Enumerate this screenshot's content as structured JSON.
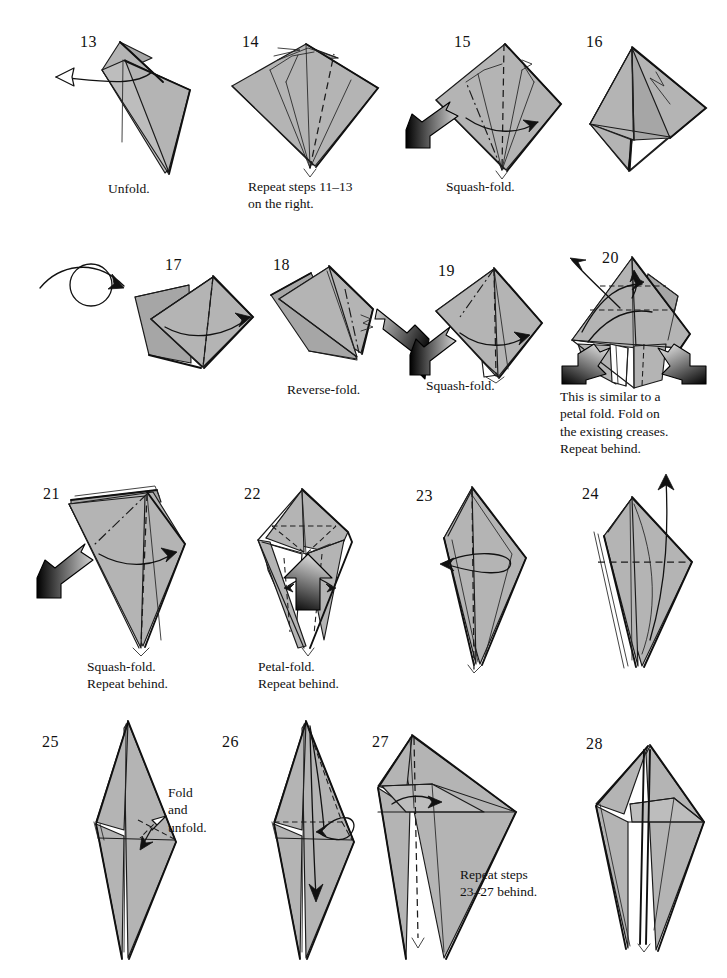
{
  "document": {
    "kind": "origami-folding-instructions",
    "page_background": "#ffffff",
    "paper_fill": "#b4b4b4",
    "line_color": "#1a1a1a",
    "step_range": "13-28"
  },
  "steps": [
    {
      "number": "13",
      "caption": "Unfold.",
      "action": "unfold",
      "arrows": [
        "open-arrow-left"
      ]
    },
    {
      "number": "14",
      "caption": "Repeat steps 11–13\non the right.",
      "action": "repeat",
      "arrows": []
    },
    {
      "number": "15",
      "caption": "Squash-fold.",
      "action": "squash-fold",
      "arrows": [
        "push-arrow",
        "fold-arrow-right"
      ]
    },
    {
      "number": "16",
      "caption": "",
      "action": "result",
      "arrows": []
    },
    {
      "number": "17",
      "caption": "",
      "action": "turn-over",
      "arrows": [
        "turn-over-arrow",
        "fold-arrow-right"
      ]
    },
    {
      "number": "18",
      "caption": "Reverse-fold.",
      "action": "reverse-fold",
      "arrows": [
        "push-arrow"
      ]
    },
    {
      "number": "19",
      "caption": "Squash-fold.",
      "action": "squash-fold",
      "arrows": [
        "push-arrow",
        "fold-arrow-right"
      ]
    },
    {
      "number": "20",
      "caption": "This is similar to a\npetal fold. Fold on\nthe existing creases.\nRepeat behind.",
      "action": "petal-fold",
      "arrows": [
        "push-arrow-left",
        "push-arrow-right",
        "pull-arrow-up",
        "fold-arrow-up"
      ]
    },
    {
      "number": "21",
      "caption": "Squash-fold.\nRepeat behind.",
      "action": "squash-fold",
      "arrows": [
        "push-arrow",
        "fold-arrow-right"
      ]
    },
    {
      "number": "22",
      "caption": "Petal-fold.\nRepeat behind.",
      "action": "petal-fold",
      "arrows": [
        "push-arrow-up",
        "pinch-arrow-left",
        "pinch-arrow-right"
      ]
    },
    {
      "number": "23",
      "caption": "",
      "action": "fold-over",
      "arrows": [
        "roll-arrow-left"
      ]
    },
    {
      "number": "24",
      "caption": "",
      "action": "fold-up",
      "arrows": [
        "pull-arrow-up"
      ]
    },
    {
      "number": "25",
      "caption": "",
      "note": "Fold and\nunfold.",
      "action": "fold-and-unfold",
      "arrows": [
        "open-arrow-double"
      ]
    },
    {
      "number": "26",
      "caption": "",
      "action": "fold-down",
      "arrows": [
        "loop-arrow-down"
      ]
    },
    {
      "number": "27",
      "caption": "",
      "action": "fold-right",
      "arrows": [
        "fold-arrow-right"
      ]
    },
    {
      "number": "28",
      "caption": "Repeat steps\n23–27 behind.",
      "action": "repeat-behind",
      "arrows": []
    }
  ]
}
